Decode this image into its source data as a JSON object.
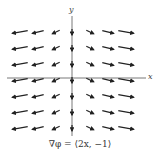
{
  "diagram": {
    "type": "vector_field",
    "caption": "∇φ = ⟨2x, −1⟩",
    "x_axis_label": "x",
    "y_axis_label": "y",
    "field": {
      "fx": "2x",
      "fy": "-1"
    },
    "grid_x": [
      -3,
      -2,
      -1,
      0,
      1,
      2,
      3
    ],
    "grid_y": [
      3,
      2,
      1,
      0,
      -1,
      -2,
      -3
    ],
    "colors": {
      "arrow": "#222222",
      "axis": "#555555",
      "background": "#ffffff"
    }
  }
}
